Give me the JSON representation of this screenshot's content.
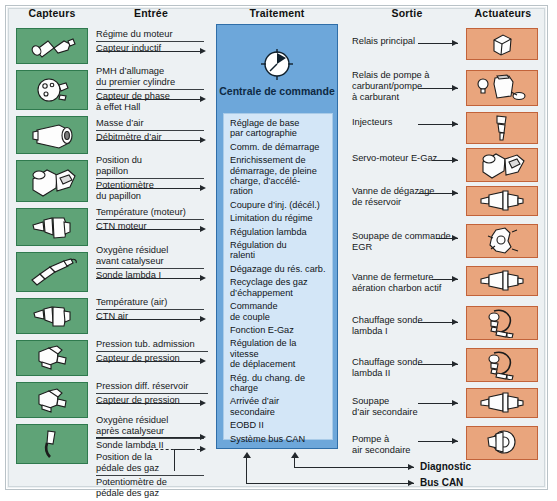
{
  "headers": {
    "sensors": "Capteurs",
    "input": "Entrée",
    "processing": "Traitement",
    "output": "Sortie",
    "actuators": "Actuateurs"
  },
  "colors": {
    "sensor_box": "#5fa377",
    "sensor_box_border": "#2f7a4e",
    "actuator_box": "#e9a57d",
    "actuator_box_border": "#c2633a",
    "ecu_box": "#6da7da",
    "ecu_box_border": "#2f6ea8",
    "ecu_list": "#d3e6f7",
    "frame": "#edf1f3",
    "line": "#23282c"
  },
  "sensors": [
    {
      "icon": "inductive-speed-sensor-icon",
      "signal": "Régime du moteur",
      "device": "Capteur inductif"
    },
    {
      "icon": "hall-phase-sensor-icon",
      "signal": "PMH d’allumage\ndu premier cylindre",
      "device": "Capteur de phase\nà effet Hall"
    },
    {
      "icon": "air-mass-meter-icon",
      "signal": "Masse d’air",
      "device": "Débitmètre d’air"
    },
    {
      "icon": "throttle-potentiometer-icon",
      "signal": "Position du\npapillon",
      "device": "Potentiomètre\ndu papillon"
    },
    {
      "icon": "engine-temperature-sensor-icon",
      "signal": "Température (moteur)",
      "device": "CTN moteur"
    },
    {
      "icon": "lambda-probe-icon",
      "signal": "Oxygène résiduel\navant catalyseur",
      "device": "Sonde lambda I"
    },
    {
      "icon": "air-temperature-sensor-icon",
      "signal": "Température (air)",
      "device": "CTN air"
    },
    {
      "icon": "manifold-pressure-sensor-icon",
      "signal": "Pression tub. admission",
      "device": "Capteur de pression"
    },
    {
      "icon": "tank-pressure-sensor-icon",
      "signal": "Pression diff. réservoir",
      "device": "Capteur de pression"
    },
    {
      "icon": "lambda-probe-icon",
      "signal": "Oxygène résiduel\naprès catalyseur",
      "device": "Sonde lambda II"
    },
    {
      "icon": "accelerator-pedal-sensor-icon",
      "signal": "Position de la\npédale des gaz",
      "device": "Potentiomètre de\npédale des gaz"
    }
  ],
  "ecu": {
    "icon": "ecu-chip-icon",
    "title": "Centrale de\ncommande",
    "functions": [
      "Réglage de base\npar cartographie",
      "Comm. de démarrage",
      "Enrichissement de\ndémarrage, de pleine\ncharge, d’accélé-\nration",
      "Coupure d’inj. (décél.)",
      "Limitation du régime",
      "Régulation lambda",
      "Régulation du\nralenti",
      "Dégazage du rés. carb.",
      "Recyclage des gaz\nd’échappement",
      "Commande\nde couple",
      "Fonction E-Gaz",
      "Régulation de la vitesse\nde déplacement",
      "Rég. du chang. de charge",
      "Arrivée d’air\nsecondaire",
      "EOBD II",
      "Système bus CAN"
    ]
  },
  "outputs": [
    {
      "icon": "main-relay-icon",
      "label": "Relais principal"
    },
    {
      "icon": "fuel-pump-relay-icon",
      "label": "Relais de pompe à\ncarburant/pompe\nà carburant"
    },
    {
      "icon": "injector-icon",
      "label": "Injecteurs"
    },
    {
      "icon": "e-gas-servo-motor-icon",
      "label": "Servo-moteur E-Gaz"
    },
    {
      "icon": "tank-vent-valve-icon",
      "label": "Vanne de dégazage\nde réservoir"
    },
    {
      "icon": "egr-valve-icon",
      "label": "Soupape de commande\nEGR"
    },
    {
      "icon": "charcoal-shutoff-valve-icon",
      "label": "Vanne de fermeture\naération charbon actif"
    },
    {
      "icon": "lambda-heater-icon",
      "label": "Chauffage sonde\nlambda I"
    },
    {
      "icon": "lambda-heater-icon",
      "label": "Chauffage sonde\nlambda II"
    },
    {
      "icon": "secondary-air-valve-icon",
      "label": "Soupape\nd’air secondaire"
    },
    {
      "icon": "secondary-air-pump-icon",
      "label": "Pompe à\nair secondaire"
    }
  ],
  "buses": [
    {
      "label": "Diagnostic"
    },
    {
      "label": "Bus CAN"
    }
  ]
}
